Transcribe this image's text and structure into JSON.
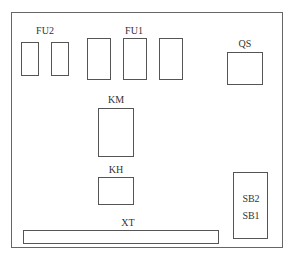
{
  "diagram": {
    "type": "electrical panel component layout",
    "labels": {
      "fu2": "FU2",
      "fu1": "FU1",
      "qs": "QS",
      "km": "KM",
      "kh": "KH",
      "xt": "XT",
      "sb2": "SB2",
      "sb1": "SB1"
    },
    "components": [
      {
        "id": "FU2",
        "count": 2,
        "description": "control circuit fuses"
      },
      {
        "id": "FU1",
        "count": 3,
        "description": "main circuit fuses"
      },
      {
        "id": "QS",
        "count": 1,
        "description": "isolating switch"
      },
      {
        "id": "KM",
        "count": 1,
        "description": "contactor"
      },
      {
        "id": "KH",
        "count": 1,
        "description": "thermal relay"
      },
      {
        "id": "XT",
        "count": 1,
        "description": "terminal block"
      },
      {
        "id": "SB2/SB1",
        "count": 1,
        "description": "push-button station"
      }
    ]
  }
}
